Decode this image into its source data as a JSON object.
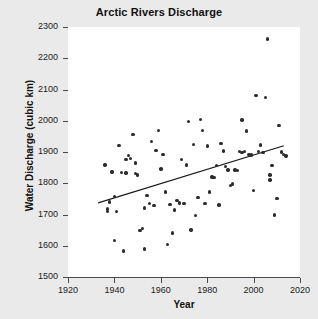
{
  "chart_data": {
    "type": "scatter",
    "title": "Arctic Rivers Discharge",
    "xlabel": "Year",
    "ylabel": "Water Discharge (cubic km)",
    "xlim": [
      1920,
      2020
    ],
    "ylim": [
      1500,
      2300
    ],
    "xticks": [
      1920,
      1940,
      1960,
      1980,
      2000,
      2020
    ],
    "yticks": [
      1500,
      1600,
      1700,
      1800,
      1900,
      2000,
      2100,
      2200,
      2300
    ],
    "grid": false,
    "legend": null,
    "marker_color": "#2b2b2b",
    "trendline_color": "#1a1a1a",
    "plot_background": "#ffffff",
    "figure_background": "#eaeaea",
    "series": [
      {
        "name": "Annual discharge",
        "x": [
          1936,
          1937,
          1937,
          1938,
          1939,
          1940,
          1940,
          1941,
          1942,
          1943,
          1944,
          1945,
          1945,
          1946,
          1947,
          1948,
          1949,
          1949,
          1950,
          1951,
          1952,
          1953,
          1953,
          1954,
          1955,
          1956,
          1957,
          1958,
          1959,
          1960,
          1961,
          1962,
          1963,
          1964,
          1965,
          1966,
          1967,
          1968,
          1969,
          1970,
          1971,
          1972,
          1973,
          1974,
          1975,
          1976,
          1977,
          1978,
          1979,
          1980,
          1981,
          1982,
          1983,
          1984,
          1985,
          1986,
          1987,
          1988,
          1989,
          1990,
          1991,
          1992,
          1993,
          1994,
          1995,
          1995,
          1996,
          1997,
          1998,
          1999,
          2000,
          2001,
          2002,
          2003,
          2004,
          2005,
          2006,
          2007,
          2007,
          2008,
          2009,
          2010,
          2011,
          2012,
          2013,
          2014
        ],
        "y": [
          1858,
          1718,
          1710,
          1740,
          1836,
          1616,
          1757,
          1709,
          1920,
          1835,
          1583,
          1876,
          1833,
          1889,
          1880,
          1957,
          1865,
          1831,
          1827,
          1648,
          1655,
          1590,
          1721,
          1760,
          1736,
          1934,
          1729,
          1905,
          1968,
          1846,
          1893,
          1772,
          1605,
          1733,
          1641,
          1714,
          1744,
          1737,
          1877,
          1735,
          1859,
          1998,
          1651,
          1925,
          1697,
          1755,
          2004,
          1968,
          1735,
          1919,
          1772,
          1820,
          1818,
          1856,
          1730,
          1927,
          1903,
          1853,
          1843,
          1793,
          1798,
          1843,
          1841,
          1901,
          1899,
          2003,
          1901,
          1967,
          1893,
          1890,
          1777,
          2081,
          1901,
          1922,
          1898,
          2074,
          2262,
          1826,
          1810,
          1856,
          1699,
          1752,
          1985,
          1900,
          1892,
          1887
        ]
      }
    ],
    "trendline": {
      "x_start": 1933,
      "y_start": 1737,
      "x_end": 2013,
      "y_end": 1920
    }
  }
}
